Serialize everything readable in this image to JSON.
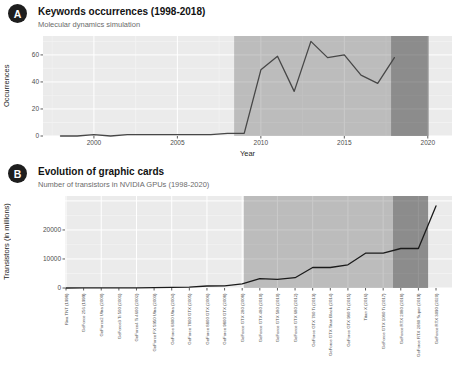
{
  "panels": [
    {
      "badge": "A"
    },
    {
      "badge": "B"
    }
  ],
  "chart_data": [
    {
      "type": "line",
      "title": "Keywords occurrences (1998-2018)",
      "subtitle": "Molecular dynamics simulation",
      "xlabel": "Year",
      "ylabel": "Occurrences",
      "x": [
        1998,
        1999,
        2000,
        2001,
        2002,
        2003,
        2004,
        2005,
        2006,
        2007,
        2008,
        2009,
        2010,
        2011,
        2012,
        2013,
        2014,
        2015,
        2016,
        2017,
        2018
      ],
      "values": [
        0,
        0,
        1,
        0,
        1,
        1,
        1,
        1,
        1,
        1,
        2,
        2,
        49,
        59,
        33,
        70,
        58,
        60,
        45,
        39,
        58
      ],
      "xlim": [
        1996.95,
        2021.45
      ],
      "ylim": [
        0,
        74
      ],
      "xticks": [
        2000,
        2005,
        2010,
        2015,
        2020
      ],
      "xticks_minor": [
        1997.5,
        2002.5,
        2007.5,
        2012.5,
        2017.5
      ],
      "yticks": [
        0,
        20,
        40,
        60
      ],
      "yticks_minor": [
        10,
        30,
        50,
        70
      ],
      "grid": true,
      "legend": false,
      "plot_bg": "#ebebeb",
      "line_color": "#474747",
      "bands": [
        {
          "x0": 2008.4,
          "x1": 2017.8,
          "color": "#5a5a5a",
          "opacity": 0.32,
          "label": "highlight-band-2008-2018"
        },
        {
          "x0": 2017.8,
          "x1": 2020.05,
          "color": "#2e2e2e",
          "opacity": 0.5,
          "label": "highlight-band-2018-2020"
        }
      ]
    },
    {
      "type": "line",
      "title": "Evolution of graphic cards",
      "subtitle": "Number of transistors in NVIDIA GPUs (1998-2020)",
      "xlabel": "",
      "ylabel": "Transistors (in millions)",
      "categories": [
        "Riva TNT (1998)",
        "GeForce 256 (1999)",
        "GeForce2 Ultra (2000)",
        "GeForce3 Ti 500 (2001)",
        "GeForce4 Ti 4600 (2002)",
        "GeForce FX 5950 Ultra (2003)",
        "GeForce 6800 Ultra (2004)",
        "GeForce 7800 GTX (2005)",
        "GeForce 8800 GTX (2006)",
        "GeForce 9800 GTX (2008)",
        "GeForce GTX 280 (2008)",
        "GeForce GTX 480 (2010)",
        "GeForce GTX 580 (2010)",
        "GeForce GTX 680 (2012)",
        "GeForce GTX 780 Ti (2013)",
        "GeForce GTX Titan Black (2014)",
        "GeForce GTX 980 Ti (2015)",
        "Titan X (2016)",
        "GeForce GTX 1080 Ti (2017)",
        "GeForce RTX 2080 (2018)",
        "GeForce RTX 2080 Super (2019)",
        "GeForce RTX 3090 (2020)"
      ],
      "values": [
        7,
        23,
        25,
        57,
        63,
        135,
        222,
        302,
        681,
        754,
        1400,
        3200,
        3000,
        3540,
        7080,
        7080,
        8000,
        12000,
        12000,
        13600,
        13600,
        28300
      ],
      "ylim": [
        0,
        31700
      ],
      "yticks": [
        0,
        10000,
        20000
      ],
      "yticks_grid": [
        0,
        10000,
        20000,
        30000
      ],
      "yticks_minor": [
        5000,
        15000,
        25000
      ],
      "grid": true,
      "legend": false,
      "plot_bg": "#ebebeb",
      "line_color": "#1b1b1b",
      "bands": [
        {
          "x0": 10.1,
          "x1": 18.56,
          "color": "#5a5a5a",
          "opacity": 0.32,
          "label": "highlight-band-gpu-era"
        },
        {
          "x0": 18.56,
          "x1": 20.55,
          "color": "#2e2e2e",
          "opacity": 0.5,
          "label": "highlight-band-rtx-era"
        }
      ]
    }
  ]
}
